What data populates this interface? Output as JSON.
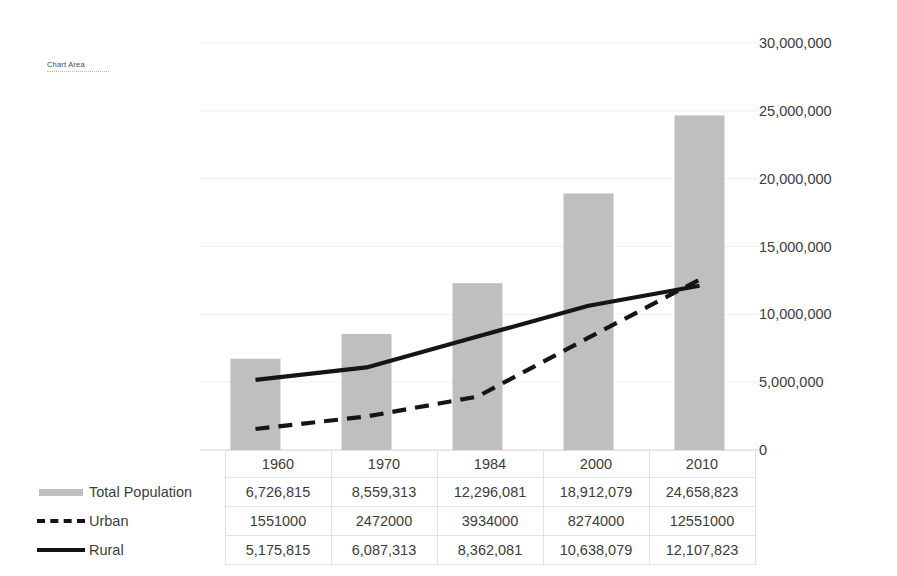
{
  "tooltip": {
    "label": "Chart Area"
  },
  "top_sliver": {
    "fragments": [
      "",
      "",
      ""
    ]
  },
  "axis": {
    "y_ticks": [
      "0",
      "5,000,000",
      "10,000,000",
      "15,000,000",
      "20,000,000",
      "25,000,000",
      "30,000,000"
    ]
  },
  "table": {
    "corner": "",
    "series_labels": [
      "Total Population",
      "Urban",
      "Rural"
    ],
    "years": [
      "1960",
      "1970",
      "1984",
      "2000",
      "2010"
    ],
    "rows": [
      [
        "6,726,815",
        "8,559,313",
        "12,296,081",
        "18,912,079",
        "24,658,823"
      ],
      [
        "1551000",
        "2472000",
        "3934000",
        "8274000",
        "12551000"
      ],
      [
        "5,175,815",
        "6,087,313",
        "8,362,081",
        "10,638,079",
        "12,107,823"
      ]
    ]
  },
  "colors": {
    "bar": "#bfbfbf",
    "line": "#151515",
    "gridline": "#f0f0f4",
    "table_border": "#e3e3e3",
    "text": "#3c3c3c"
  },
  "chart_data": {
    "type": "bar",
    "title": "",
    "xlabel": "",
    "ylabel": "",
    "ylim": [
      0,
      30000000
    ],
    "grid": true,
    "legend_position": "data-table",
    "categories": [
      "1960",
      "1970",
      "1984",
      "2000",
      "2010"
    ],
    "series": [
      {
        "name": "Total Population",
        "type": "bar",
        "color": "#bfbfbf",
        "values": [
          6726815,
          8559313,
          12296081,
          18912079,
          24658823
        ]
      },
      {
        "name": "Urban",
        "type": "line",
        "style": "dashed",
        "color": "#151515",
        "values": [
          1551000,
          2472000,
          3934000,
          8274000,
          12551000
        ]
      },
      {
        "name": "Rural",
        "type": "line",
        "style": "solid",
        "color": "#151515",
        "values": [
          5175815,
          6087313,
          8362081,
          10638079,
          12107823
        ]
      }
    ],
    "ytick_values": [
      0,
      5000000,
      10000000,
      15000000,
      20000000,
      25000000,
      30000000
    ]
  }
}
